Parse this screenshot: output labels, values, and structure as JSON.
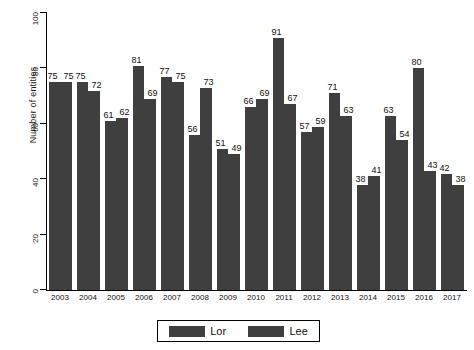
{
  "chart_data": {
    "type": "bar",
    "title": "",
    "xlabel": "",
    "ylabel": "Number of entities",
    "ylim": [
      0,
      100
    ],
    "yticks": [
      0,
      20,
      40,
      60,
      80,
      100
    ],
    "grid": false,
    "legend_position": "bottom",
    "categories": [
      "2003",
      "2004",
      "2005",
      "2006",
      "2007",
      "2008",
      "2009",
      "2010",
      "2011",
      "2012",
      "2013",
      "2014",
      "2015",
      "2016",
      "2017"
    ],
    "series": [
      {
        "name": "Lor",
        "values": [
          75,
          75,
          61,
          81,
          77,
          56,
          51,
          66,
          91,
          57,
          71,
          38,
          63,
          80,
          42
        ]
      },
      {
        "name": "Lee",
        "values": [
          75,
          72,
          62,
          69,
          75,
          73,
          49,
          69,
          67,
          59,
          63,
          41,
          54,
          43,
          38
        ]
      }
    ],
    "colors": {
      "lor": "#3f3f3f",
      "lee": "#3f3f3f",
      "axis": "#000000",
      "background": "#ffffff"
    }
  },
  "legend": {
    "items": [
      {
        "label": "Lor"
      },
      {
        "label": "Lee"
      }
    ]
  }
}
